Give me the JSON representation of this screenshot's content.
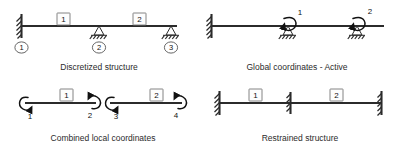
{
  "figure": {
    "title_present": false,
    "panels": [
      {
        "id": "discretized-structure",
        "caption": "Discretized structure",
        "element_labels": [
          "1",
          "2"
        ],
        "node_labels": [
          "1",
          "2",
          "3"
        ],
        "supports": [
          "fixed-wall",
          "pin-triangle",
          "pin-triangle"
        ]
      },
      {
        "id": "global-coordinates-active",
        "caption": "Global coordinates - Active",
        "dof_labels": [
          "1",
          "2"
        ],
        "supports": [
          "fixed-wall",
          "pin-triangle",
          "pin-triangle"
        ]
      },
      {
        "id": "combined-local-coordinates",
        "caption": "Combined local coordinates",
        "element_labels": [
          "1",
          "2"
        ],
        "dof_labels": [
          "1",
          "2",
          "3",
          "4"
        ]
      },
      {
        "id": "restrained-structure",
        "caption": "Restrained structure",
        "element_labels": [
          "1",
          "2"
        ],
        "supports": [
          "fixed-wall",
          "fixed-mid",
          "fixed-wall"
        ]
      }
    ]
  },
  "colors": {
    "line": "#2b2b2b",
    "text": "#111111",
    "background": "#ffffff",
    "box_stroke": "#777777"
  }
}
